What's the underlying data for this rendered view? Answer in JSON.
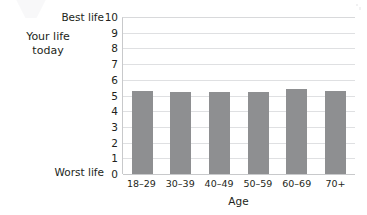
{
  "chart_data": {
    "type": "bar",
    "title": "",
    "xlabel": "Age",
    "ylabel": "",
    "categories": [
      "18–29",
      "30–39",
      "40–49",
      "50–59",
      "60–69",
      "70+"
    ],
    "values": [
      5.3,
      5.2,
      5.25,
      5.2,
      5.4,
      5.3
    ],
    "ylim": [
      0,
      10
    ],
    "yticks": [
      "10",
      "9",
      "8",
      "7",
      "6",
      "5",
      "4",
      "3",
      "2",
      "1",
      "0"
    ],
    "grid": true,
    "legend": "none",
    "series_color": "#8e8f91",
    "annotations": {
      "y_axis_top_label": "Best life",
      "y_axis_bottom_label": "Worst life",
      "side_label_line1": "Your life",
      "side_label_line2": "today"
    }
  },
  "icons": {
    "watermark_v": "watermark-v-artifact",
    "watermark_dot": "watermark-dot-artifact"
  }
}
